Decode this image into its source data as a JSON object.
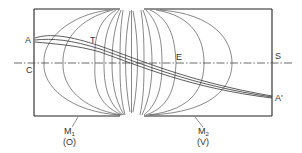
{
  "diagram": {
    "labels": {
      "A": "A",
      "T": "T",
      "C": "C",
      "E": "E",
      "S": "S",
      "A_prime": "A'",
      "M1": "M",
      "M1_sub": "1",
      "M1_note": "(O)",
      "M2": "M",
      "M2_sub": "2",
      "M2_note": "(V)"
    },
    "colors": {
      "line": "#444444",
      "frame": "#222222",
      "background": "#ffffff"
    }
  }
}
